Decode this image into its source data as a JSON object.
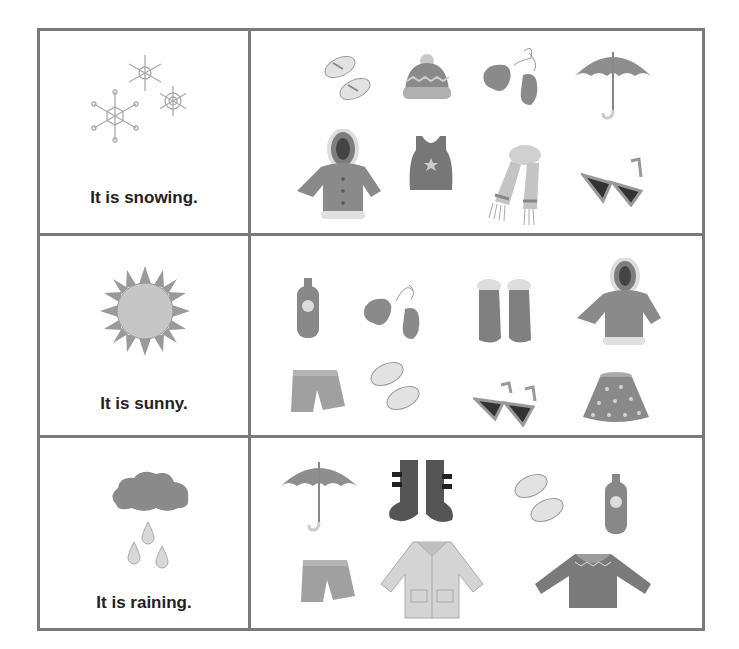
{
  "worksheet": {
    "rows": [
      {
        "weather": "snowing",
        "weather_icon": "snowflakes-icon",
        "caption": "It is snowing.",
        "items": [
          "flip-flops",
          "knit-hat",
          "mittens",
          "umbrella",
          "winter-coat",
          "tank-top",
          "scarf",
          "sunglasses"
        ]
      },
      {
        "weather": "sunny",
        "weather_icon": "sun-icon",
        "caption": "It is sunny.",
        "items": [
          "sunscreen",
          "mittens",
          "winter-boots",
          "winter-coat",
          "shorts",
          "flip-flops",
          "sunglasses",
          "skirt"
        ]
      },
      {
        "weather": "raining",
        "weather_icon": "rain-cloud-icon",
        "caption": "It is raining.",
        "items": [
          "umbrella",
          "rain-boots",
          "flip-flops",
          "sunscreen",
          "shorts",
          "raincoat",
          "sweater"
        ]
      }
    ]
  },
  "colors": {
    "border": "#7a7a7a",
    "text": "#222222",
    "item_fill": "#9a9a9a",
    "item_light": "#d8d8d8",
    "item_dark": "#555555"
  }
}
